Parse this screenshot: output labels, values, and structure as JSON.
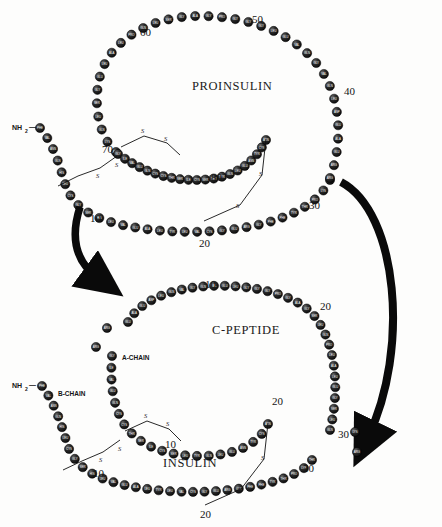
{
  "figure": {
    "type": "biochemical-diagram",
    "background_color": "#fdfdfc",
    "bead_color": "#161616",
    "ink_color": "#111111"
  },
  "titles": {
    "proinsulin": "PROINSULIN",
    "c_peptide": "C-PEPTIDE",
    "insulin": "INSULIN"
  },
  "chain_labels": {
    "a_chain": "A-CHAIN",
    "b_chain": "B-CHAIN"
  },
  "termini": {
    "proinsulin_n": "NH",
    "proinsulin_n_sub": "2",
    "proinsulin_n_dash": "—",
    "insulin_b_n": "NH",
    "insulin_b_n_sub": "2",
    "insulin_b_n_dash": "—"
  },
  "bond_labels": {
    "sulfur": "S"
  },
  "proinsulin": {
    "position_numbers": [
      "10",
      "20",
      "30",
      "40",
      "50",
      "60",
      "70",
      "80"
    ],
    "residues_b_chain": [
      "PHE",
      "VAL",
      "ASN",
      "GLN",
      "HIS",
      "LEU",
      "CYS",
      "GLY",
      "SER",
      "HIS",
      "LEU",
      "VAL",
      "GLU",
      "ALA",
      "LEU",
      "TYR",
      "LEU",
      "VAL",
      "CYS",
      "GLY",
      "GLU",
      "ARG",
      "GLY",
      "PHE",
      "PHE",
      "TYR",
      "THR",
      "PRO",
      "LYS",
      "THR"
    ],
    "residues_connecting": [
      "ARG",
      "ARG",
      "GLU",
      "ALA",
      "GLU",
      "ASP",
      "LEU",
      "GLN",
      "VAL",
      "GLY",
      "GLN",
      "VAL",
      "GLU",
      "LEU",
      "GLY",
      "GLY",
      "GLY",
      "PRO",
      "GLY",
      "ALA",
      "GLY",
      "SER",
      "LEU",
      "GLN",
      "PRO",
      "LEU",
      "ALA",
      "LEU",
      "GLU",
      "GLY",
      "SER",
      "LEU",
      "GLN",
      "LYS",
      "ARG"
    ],
    "residues_a_chain": [
      "GLY",
      "ILE",
      "VAL",
      "GLU",
      "GLN",
      "CYS",
      "CYS",
      "THR",
      "SER",
      "ILE",
      "CYS",
      "SER",
      "LEU",
      "TYR",
      "GLN",
      "LEU",
      "GLU",
      "ASN",
      "TYR",
      "CYS",
      "ASN"
    ],
    "disulfide_bonds": 3
  },
  "c_peptide": {
    "position_numbers": [
      "10",
      "20",
      "30"
    ],
    "residues": [
      "GLU",
      "ALA",
      "GLU",
      "ASP",
      "LEU",
      "GLN",
      "VAL",
      "GLY",
      "GLN",
      "VAL",
      "GLU",
      "LEU",
      "GLY",
      "GLY",
      "GLY",
      "PRO",
      "GLY",
      "ALA",
      "GLY",
      "SER",
      "LEU",
      "GLN",
      "PRO",
      "LEU",
      "ALA",
      "LEU",
      "GLU",
      "GLY",
      "SER",
      "LEU",
      "GLN"
    ],
    "free_basic_residues": [
      "ARG",
      "ARG",
      "LYS",
      "ARG"
    ]
  },
  "insulin": {
    "a_chain_position_numbers": [
      "10",
      "20"
    ],
    "b_chain_position_numbers": [
      "10",
      "20",
      "30"
    ],
    "a_chain_residues": [
      "GLY",
      "ILE",
      "VAL",
      "GLU",
      "GLN",
      "CYS",
      "CYS",
      "THR",
      "SER",
      "ILE",
      "CYS",
      "SER",
      "LEU",
      "TYR",
      "GLN",
      "LEU",
      "GLU",
      "ASN",
      "TYR",
      "CYS",
      "ASN"
    ],
    "b_chain_residues": [
      "PHE",
      "VAL",
      "ASN",
      "GLN",
      "HIS",
      "LEU",
      "CYS",
      "GLY",
      "SER",
      "HIS",
      "LEU",
      "VAL",
      "GLU",
      "ALA",
      "LEU",
      "TYR",
      "LEU",
      "VAL",
      "CYS",
      "GLY",
      "GLU",
      "ARG",
      "GLY",
      "PHE",
      "PHE",
      "TYR",
      "THR",
      "PRO",
      "LYS",
      "THR"
    ],
    "disulfide_bonds": 3
  },
  "arrows": {
    "left_arrow_name": "cleavage-arrow-left",
    "right_arrow_name": "cleavage-arrow-right",
    "count": 2
  }
}
